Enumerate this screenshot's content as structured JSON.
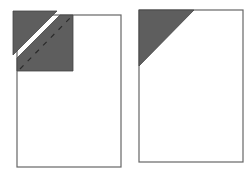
{
  "diagram": {
    "colors": {
      "sheet_fill": "#ffffff",
      "sheet_stroke": "#666666",
      "corner_fill": "#5e5e5e",
      "fold_line": "#333333"
    },
    "panels": [
      {
        "id": "left",
        "state": "corner cut off and folded, with dashed fold line",
        "sheet": {
          "x": 17,
          "y": 15,
          "w": 104,
          "h": 152
        },
        "detached_corner": [
          [
            13,
            11
          ],
          [
            57,
            11
          ],
          [
            13,
            55
          ]
        ],
        "folded_piece": [
          [
            60,
            15
          ],
          [
            73,
            15
          ],
          [
            73,
            71
          ],
          [
            17,
            71
          ],
          [
            17,
            58
          ]
        ],
        "dashed_line": {
          "x1": 20,
          "y1": 69,
          "x2": 71,
          "y2": 17
        }
      },
      {
        "id": "right",
        "state": "shaded triangular corner",
        "sheet": {
          "x": 139,
          "y": 10,
          "w": 104,
          "h": 152
        },
        "corner": [
          [
            139,
            10
          ],
          [
            194,
            10
          ],
          [
            139,
            66
          ]
        ]
      }
    ]
  }
}
